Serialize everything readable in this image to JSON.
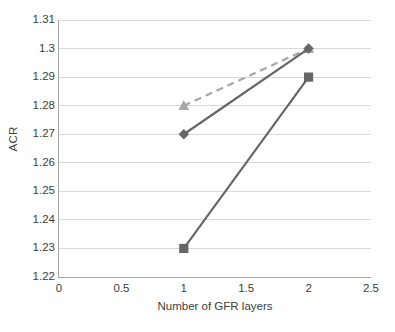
{
  "chart_data": {
    "type": "line",
    "title": "",
    "subtitle": "",
    "xlabel": "Number of GFR layers",
    "ylabel": "ACR",
    "xlim": [
      0,
      2.5
    ],
    "ylim": [
      1.22,
      1.31
    ],
    "x_ticks": [
      "0",
      "0.5",
      "1",
      "1.5",
      "2",
      "2.5"
    ],
    "x_tick_values": [
      0,
      0.5,
      1,
      1.5,
      2,
      2.5
    ],
    "y_ticks": [
      "1.22",
      "1.23",
      "1.24",
      "1.25",
      "1.26",
      "1.27",
      "1.28",
      "1.29",
      "1.3",
      "1.31"
    ],
    "y_tick_values": [
      1.22,
      1.23,
      1.24,
      1.25,
      1.26,
      1.27,
      1.28,
      1.29,
      1.3,
      1.31
    ],
    "grid": "horizontal",
    "legend": "none",
    "x": [
      1,
      2
    ],
    "series": [
      {
        "name": "series-1-dashed-triangle",
        "values": [
          1.28,
          1.3
        ],
        "color": "#a6a6a6",
        "style": "dashed",
        "marker": "triangle"
      },
      {
        "name": "series-2-solid-diamond",
        "values": [
          1.27,
          1.3
        ],
        "color": "#666666",
        "style": "solid",
        "marker": "diamond"
      },
      {
        "name": "series-3-solid-square",
        "values": [
          1.23,
          1.29
        ],
        "color": "#666666",
        "style": "solid",
        "marker": "square"
      }
    ],
    "colors": {
      "grid": "#d9d9d9",
      "axis": "#a6a6a6",
      "text": "#3c3c3c",
      "series_light": "#a6a6a6",
      "series_dark": "#666666",
      "background": "#ffffff"
    }
  }
}
